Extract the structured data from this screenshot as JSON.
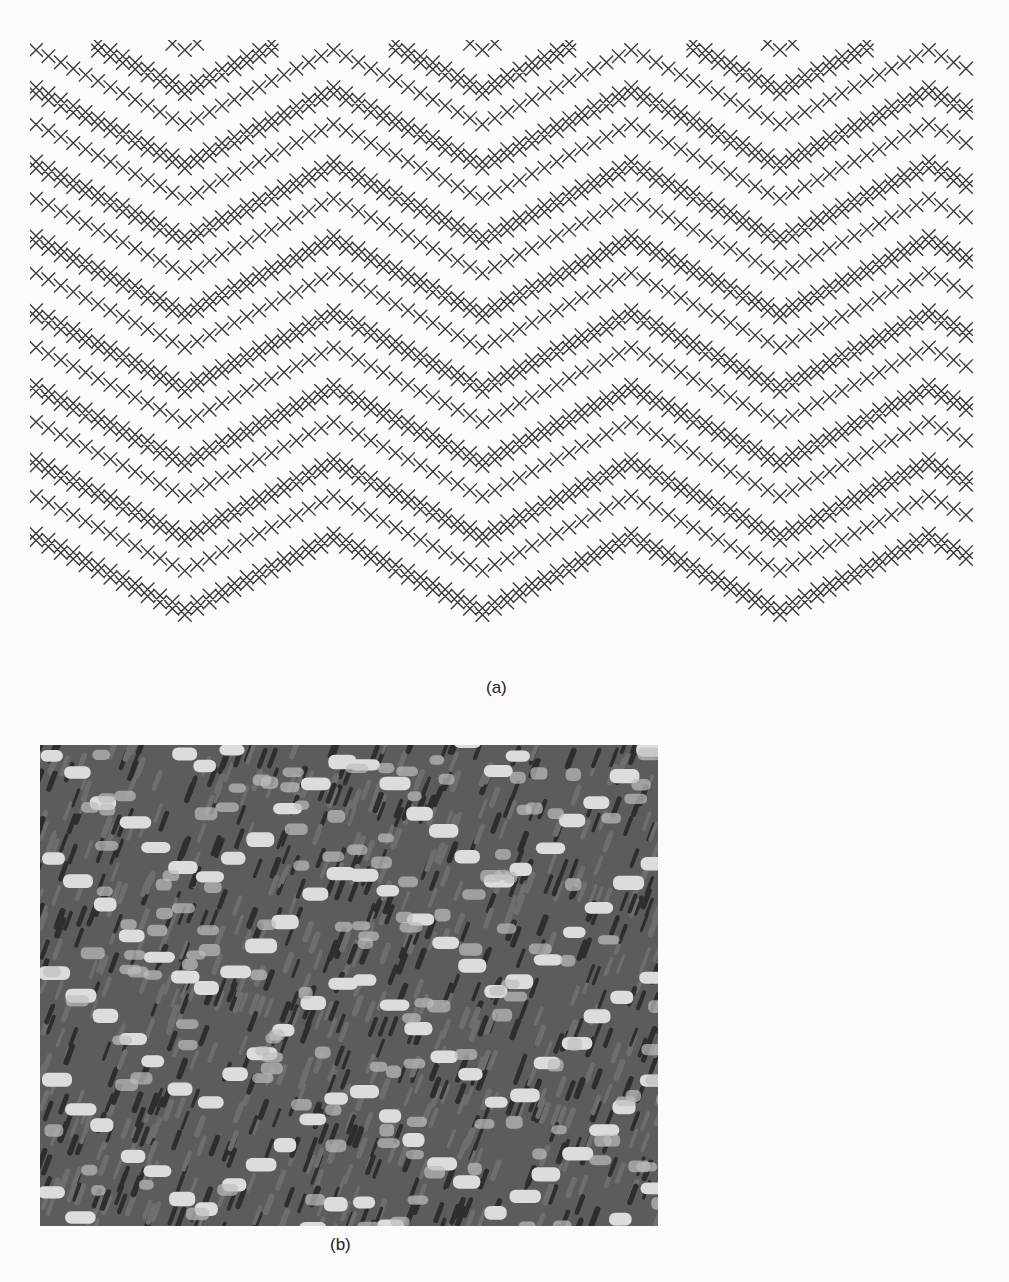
{
  "figure": {
    "panel_a": {
      "caption": "(a)",
      "description": "Herringbone weave draft: zigzag bands of diagonal cross marks",
      "pattern": {
        "cell_px": 12.4,
        "cols": 76,
        "rows": 50,
        "zigzag_half_period_cols": 12,
        "band_spacing_rows": 12,
        "mark_color": "#3a3a3a",
        "background": "#ffffff"
      }
    },
    "panel_b": {
      "caption": "(b)",
      "description": "Photograph of woven herringbone fabric",
      "palette": {
        "dark": "#2e2e2e",
        "mid": "#6e6e6e",
        "light": "#dcdcdc"
      }
    }
  }
}
